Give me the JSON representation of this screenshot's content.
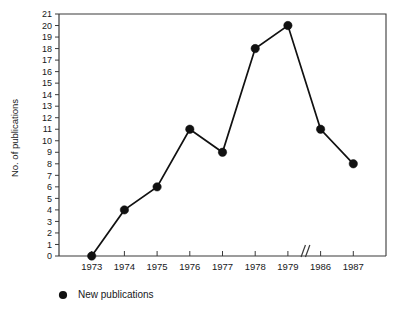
{
  "chart_data": {
    "type": "line",
    "title": "",
    "xlabel": "",
    "ylabel": "No. of publications",
    "categories": [
      "1973",
      "1974",
      "1975",
      "1976",
      "1977",
      "1978",
      "1979",
      "1986",
      "1987"
    ],
    "values": [
      0,
      4,
      6,
      11,
      9,
      18,
      20,
      11,
      8
    ],
    "series": [
      {
        "name": "New publications",
        "values": [
          0,
          4,
          6,
          11,
          9,
          18,
          20,
          11,
          8
        ]
      }
    ],
    "ylim": [
      0,
      21
    ],
    "yticks": [
      0,
      1,
      2,
      3,
      4,
      5,
      6,
      7,
      8,
      9,
      10,
      11,
      12,
      13,
      14,
      15,
      16,
      17,
      18,
      19,
      20,
      21
    ],
    "ytick_labels": [
      "0",
      "1",
      "2",
      "3",
      "4",
      "5",
      "6",
      "7",
      "8",
      "9",
      "10",
      "11",
      "12",
      "13",
      "14",
      "15",
      "16",
      "17",
      "18",
      "19",
      "20",
      "21"
    ],
    "grid": false,
    "legend_position": "below-left",
    "axis_break": {
      "present": true,
      "symbol": "//",
      "between": [
        "1979",
        "1986"
      ],
      "axis": "x"
    },
    "marker": "filled-circle",
    "line_color": "#111111",
    "marker_color": "#111111",
    "axis_color": "#3a3a3a",
    "background_color": "#ffffff"
  },
  "legend": {
    "entries": [
      {
        "label": "New publications",
        "marker": "filled-circle",
        "color": "#111111"
      }
    ]
  },
  "axes": {
    "y_title": "No. of publications"
  }
}
